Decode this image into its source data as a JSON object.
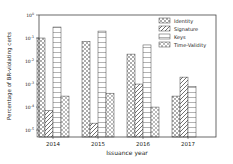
{
  "chart_data": {
    "type": "bar",
    "title": "",
    "xlabel": "Issuance year",
    "ylabel": "Percentage of BR-violating certs",
    "yscale": "log",
    "ylim": [
      5e-06,
      1
    ],
    "yticks": [
      "10^0",
      "10^-1",
      "10^-2",
      "10^-3",
      "10^-4",
      "10^-5"
    ],
    "categories": [
      "2014",
      "2015",
      "2016",
      "2017"
    ],
    "series": [
      {
        "name": "Identity",
        "values": [
          0.1,
          0.07,
          0.02,
          0.0003
        ],
        "hatch": "dots"
      },
      {
        "name": "Signature",
        "values": [
          7e-05,
          2e-05,
          0.001,
          0.002
        ],
        "hatch": "diagonal"
      },
      {
        "name": "Keys",
        "values": [
          0.3,
          0.2,
          0.05,
          0.0008
        ],
        "hatch": "horizontal"
      },
      {
        "name": "Time-Validity",
        "values": [
          0.0003,
          0.0004,
          0.0001,
          null
        ],
        "hatch": "crosshatch"
      }
    ],
    "legend_position": "upper right",
    "grid": false
  }
}
